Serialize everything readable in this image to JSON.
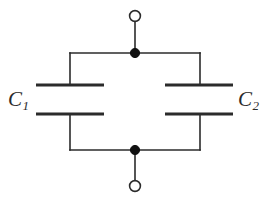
{
  "figure": {
    "type": "circuit-schematic",
    "background_color": "#ffffff",
    "line_color": "#2b2b2b",
    "label_color": "#2b2b2b",
    "width": 269,
    "height": 202
  },
  "labels": {
    "left_capacitor": {
      "symbol": "C",
      "subscript": "1",
      "full": "C1"
    },
    "right_capacitor": {
      "symbol": "C",
      "subscript": "2",
      "full": "C2"
    }
  },
  "terminals": {
    "top": {
      "name": "top-terminal",
      "style": "open-circle",
      "cx": 135,
      "cy": 16,
      "r": 5.5
    },
    "bottom": {
      "name": "bottom-terminal",
      "style": "open-circle",
      "cx": 135,
      "cy": 186,
      "r": 5.5
    }
  },
  "nodes": {
    "top": {
      "name": "top-junction",
      "style": "filled-dot",
      "cx": 135,
      "cy": 53,
      "r": 4.6
    },
    "bottom": {
      "name": "bottom-junction",
      "style": "filled-dot",
      "cx": 135,
      "cy": 150,
      "r": 4.6
    }
  },
  "wires": {
    "top_lead": {
      "x1": 135,
      "y1": 21,
      "x2": 135,
      "y2": 53
    },
    "bottom_lead": {
      "x1": 135,
      "y1": 150,
      "x2": 135,
      "y2": 181
    },
    "top_bus": {
      "x1": 70,
      "y1": 53,
      "x2": 200,
      "y2": 53
    },
    "bottom_bus": {
      "x1": 70,
      "y1": 150,
      "x2": 200,
      "y2": 150
    },
    "left_upper_branch": {
      "x1": 70,
      "y1": 53,
      "x2": 70,
      "y2": 85
    },
    "left_lower_branch": {
      "x1": 70,
      "y1": 114,
      "x2": 70,
      "y2": 150
    },
    "right_upper_branch": {
      "x1": 200,
      "y1": 53,
      "x2": 200,
      "y2": 85
    },
    "right_lower_branch": {
      "x1": 200,
      "y1": 114,
      "x2": 200,
      "y2": 150
    }
  },
  "capacitors": [
    {
      "name": "capacitor-c1",
      "label": "C1",
      "upper_plate": {
        "x1": 36,
        "y1": 85,
        "x2": 104,
        "y2": 85
      },
      "lower_plate": {
        "x1": 36,
        "y1": 114,
        "x2": 104,
        "y2": 114
      },
      "plate_gap": 29,
      "branch_x": 70
    },
    {
      "name": "capacitor-c2",
      "label": "C2",
      "upper_plate": {
        "x1": 165,
        "y1": 85,
        "x2": 233,
        "y2": 85
      },
      "lower_plate": {
        "x1": 165,
        "y1": 114,
        "x2": 233,
        "y2": 114
      },
      "plate_gap": 29,
      "branch_x": 200
    }
  ],
  "stroke": {
    "wire_width": 1.6,
    "plate_width": 3.2
  }
}
